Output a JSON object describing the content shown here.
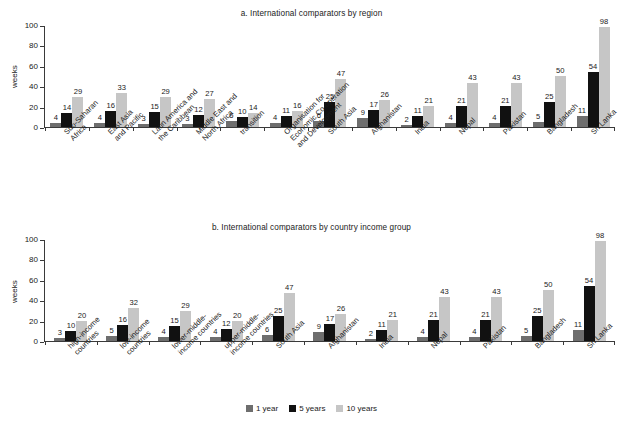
{
  "chart_data": [
    {
      "type": "bar",
      "id": "panel-a",
      "title": "a. International comparators by region",
      "xlabel": "",
      "ylabel": "weeks",
      "ylim": [
        0,
        100
      ],
      "yticks": [
        0,
        20,
        40,
        60,
        80,
        100
      ],
      "grid": false,
      "legend_position": "bottom-center-shared",
      "categories": [
        "Sub-Saharan Africa",
        "East Asia and Pacific",
        "Latin America and the Caribbean",
        "Middle East and North Africa",
        "transition",
        "Organisation for Economic Co-operation and Development",
        "South Asia",
        "Afghanistan",
        "India",
        "Nepal",
        "Pakistan",
        "Bangladesh",
        "Sri Lanka"
      ],
      "category_lines": [
        [
          "Sub-Saharan",
          "Africa"
        ],
        [
          "East Asia",
          "and Pacific"
        ],
        [
          "Latin America and",
          "the Caribbean"
        ],
        [
          "Middle East and",
          "North Africa"
        ],
        [
          "transition"
        ],
        [
          "Organisation for",
          "Economic Co-operation",
          "and Development"
        ],
        [
          "South Asia"
        ],
        [
          "Afghanistan"
        ],
        [
          "India"
        ],
        [
          "Nepal"
        ],
        [
          "Pakistan"
        ],
        [
          "Bangladesh"
        ],
        [
          "Sri Lanka"
        ]
      ],
      "series": [
        {
          "name": "1 year",
          "color": "#6e6e6e",
          "values": [
            4,
            4,
            3,
            3,
            6,
            4,
            6,
            9,
            2,
            4,
            4,
            5,
            11
          ]
        },
        {
          "name": "5 years",
          "color": "#111111",
          "values": [
            14,
            16,
            15,
            12,
            10,
            11,
            25,
            17,
            11,
            21,
            21,
            25,
            54
          ]
        },
        {
          "name": "10 years",
          "color": "#c6c6c6",
          "values": [
            29,
            33,
            29,
            27,
            14,
            16,
            47,
            26,
            21,
            43,
            43,
            50,
            98
          ]
        }
      ]
    },
    {
      "type": "bar",
      "id": "panel-b",
      "title": "b. International comparators by country income group",
      "xlabel": "",
      "ylabel": "weeks",
      "ylim": [
        0,
        100
      ],
      "yticks": [
        0,
        20,
        40,
        60,
        80,
        100
      ],
      "grid": false,
      "legend_position": "bottom-center-shared",
      "categories": [
        "high-income countries",
        "low-income countries",
        "lower-middle-income countries",
        "upper-middle-income countries",
        "South Asia",
        "Afghanistan",
        "India",
        "Nepal",
        "Pakistan",
        "Bangladesh",
        "Sri Lanka"
      ],
      "category_lines": [
        [
          "high-income",
          "countries"
        ],
        [
          "low-income",
          "countries"
        ],
        [
          "lower-middle-",
          "income countries"
        ],
        [
          "upper-middle-",
          "income countries"
        ],
        [
          "South Asia"
        ],
        [
          "Afghanistan"
        ],
        [
          "India"
        ],
        [
          "Nepal"
        ],
        [
          "Pakistan"
        ],
        [
          "Bangladesh"
        ],
        [
          "Sri Lanka"
        ]
      ],
      "series": [
        {
          "name": "1 year",
          "color": "#6e6e6e",
          "values": [
            3,
            5,
            4,
            4,
            6,
            9,
            2,
            4,
            4,
            5,
            11
          ]
        },
        {
          "name": "5 years",
          "color": "#111111",
          "values": [
            10,
            16,
            15,
            12,
            25,
            17,
            11,
            21,
            21,
            25,
            54
          ]
        },
        {
          "name": "10 years",
          "color": "#c6c6c6",
          "values": [
            20,
            32,
            29,
            20,
            47,
            26,
            21,
            43,
            43,
            50,
            98
          ]
        }
      ]
    }
  ],
  "legend": {
    "items": [
      {
        "label": "1 year",
        "color": "#6e6e6e",
        "key": "c1"
      },
      {
        "label": "5 years",
        "color": "#111111",
        "key": "c5"
      },
      {
        "label": "10 years",
        "color": "#c6c6c6",
        "key": "c10"
      }
    ]
  }
}
